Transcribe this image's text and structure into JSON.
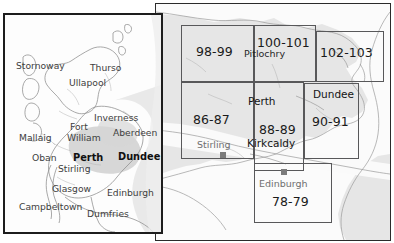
{
  "document": {
    "type": "map-index",
    "title": "Scotland road atlas page index",
    "panels": [
      "locator-inset-map",
      "index-grid-map"
    ]
  },
  "inset_map": {
    "name": "Scotland locator map",
    "highlight_region_label": "Perth and Dundee area",
    "places": [
      {
        "name": "Stornoway",
        "x": 10,
        "y": 48,
        "dot_x": 38,
        "dot_y": 57,
        "style": "l-med",
        "dot": "dot-sm"
      },
      {
        "name": "Thurso",
        "x": 86,
        "y": 50,
        "dot_x": 103,
        "dot_y": 45,
        "style": "l-med",
        "dot": "dot-sm"
      },
      {
        "name": "Ullapool",
        "x": 65,
        "y": 66,
        "dot_x": 61,
        "dot_y": 77,
        "style": "l-med",
        "dot": "dot-sm"
      },
      {
        "name": "Inverness",
        "x": 90,
        "y": 98,
        "dot_x": 85,
        "dot_y": 95,
        "style": "l-med",
        "dot": "dot-sm"
      },
      {
        "name": "Fort",
        "x": 66,
        "y": 108,
        "dot_x": 62,
        "dot_y": 122,
        "style": "l-med",
        "dot": "dot-sm"
      },
      {
        "name": "William",
        "x": 64,
        "y": 120,
        "dot_x": -99,
        "dot_y": -99,
        "style": "l-med",
        "dot": "none"
      },
      {
        "name": "Aberdeen",
        "x": 110,
        "y": 117,
        "dot_x": 133,
        "dot_y": 111,
        "style": "l-med",
        "dot": "dot-sm"
      },
      {
        "name": "Mallaig",
        "x": 16,
        "y": 120,
        "dot_x": 46,
        "dot_y": 117,
        "style": "l-med",
        "dot": "dot-sm"
      },
      {
        "name": "Perth",
        "x": 72,
        "y": 139,
        "dot_x": 96,
        "dot_y": 148,
        "style": "l-bold",
        "dot": "dot-md"
      },
      {
        "name": "Dundee",
        "x": 113,
        "y": 139,
        "dot_x": 107,
        "dot_y": 142,
        "style": "l-bold",
        "dot": "dot-md"
      },
      {
        "name": "Oban",
        "x": 28,
        "y": 142,
        "dot_x": 52,
        "dot_y": 140,
        "style": "l-med",
        "dot": "dot-sm"
      },
      {
        "name": "Stirling",
        "x": 55,
        "y": 152,
        "dot_x": 85,
        "dot_y": 155,
        "style": "l-med",
        "dot": "dot-sm"
      },
      {
        "name": "Glasgow",
        "x": 49,
        "y": 170,
        "dot_x": 74,
        "dot_y": 163,
        "style": "l-med",
        "dot": "dot-sm"
      },
      {
        "name": "Edinburgh",
        "x": 104,
        "y": 175,
        "dot_x": 106,
        "dot_y": 167,
        "style": "l-med",
        "dot": "dot-sm"
      },
      {
        "name": "Campbeltown",
        "x": 16,
        "y": 190,
        "dot_x": 46,
        "dot_y": 184,
        "style": "l-med",
        "dot": "dot-sm"
      },
      {
        "name": "Dumfries",
        "x": 84,
        "y": 196,
        "dot_x": 88,
        "dot_y": 205,
        "style": "l-med",
        "dot": "dot-sm"
      }
    ]
  },
  "index_map": {
    "name": "Page index grid",
    "cells": [
      {
        "label": "98-99",
        "x": 25,
        "y": 21,
        "w": 73,
        "h": 57,
        "lx": 40,
        "ly": 40
      },
      {
        "label": "100-101",
        "x": 98,
        "y": 21,
        "w": 62,
        "h": 57,
        "lx": 103,
        "ly": 33
      },
      {
        "label": "102-103",
        "x": 160,
        "y": 27,
        "w": 68,
        "h": 51,
        "lx": 165,
        "ly": 41
      },
      {
        "label": "86-87",
        "x": 25,
        "y": 78,
        "w": 73,
        "h": 77,
        "lx": 37,
        "ly": 108
      },
      {
        "label": "88-89",
        "x": 98,
        "y": 78,
        "w": 50,
        "h": 89,
        "lx": 104,
        "ly": 118
      },
      {
        "label": "90-91",
        "x": 148,
        "y": 79,
        "w": 55,
        "h": 76,
        "lx": 157,
        "ly": 110
      },
      {
        "label": "78-79",
        "x": 98,
        "y": 159,
        "w": 78,
        "h": 60,
        "lx": 117,
        "ly": 190
      }
    ],
    "places": [
      {
        "name": "Pitlochry",
        "x": 103,
        "y": 45,
        "dot_x": 110,
        "dot_y": 58,
        "style": "lbl-mid",
        "dot": "dot-lg"
      },
      {
        "name": "Perth",
        "x": 100,
        "y": 92,
        "dot_x": 116,
        "dot_y": 105,
        "style": "lbl-strong",
        "dot": "dot-lg"
      },
      {
        "name": "Dundee",
        "x": 161,
        "y": 86,
        "dot_x": 148,
        "dot_y": 94,
        "style": "lbl-strong",
        "dot": "dot-lg"
      },
      {
        "name": "Kirkcaldy",
        "x": 98,
        "y": 135,
        "dot_x": 128,
        "dot_y": 148,
        "style": "lbl-strong",
        "dot": "dot-lg"
      },
      {
        "name": "Stirling",
        "x": 45,
        "y": 136,
        "dot_x": 65,
        "dot_y": 148,
        "style": "lbl-faint2",
        "dot": "dot-md grey"
      },
      {
        "name": "Edinburgh",
        "x": 105,
        "y": 175,
        "dot_x": 126,
        "dot_y": 166,
        "style": "lbl-faint2",
        "dot": "dot-md grey"
      }
    ]
  }
}
